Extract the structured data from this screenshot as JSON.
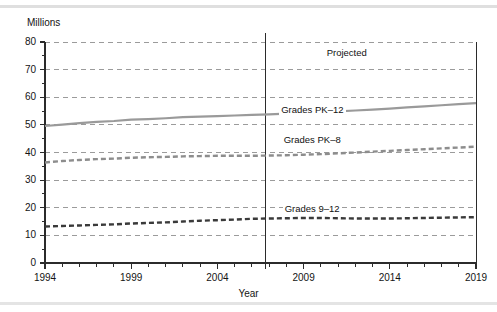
{
  "figure": {
    "y_axis_title": "Millions",
    "x_axis_title": "Year",
    "projected_label": "Projected",
    "series_labels": {
      "pk12": "Grades PK–12",
      "pk8": "Grades PK–8",
      "g912": "Grades 9–12"
    },
    "colors": {
      "pk12_line": "#9a9a9a",
      "pk8_line": "#8d8d8d",
      "g912_line": "#3a3a3a",
      "gridline": "#9b9b9b",
      "axis": "#2b2b2b",
      "text": "#141414",
      "scan_band": "#d9d9d9"
    }
  },
  "chart_data": {
    "type": "line",
    "title": "",
    "subtitle": "",
    "xlabel": "Year",
    "ylabel": "Millions",
    "xlim": [
      1994,
      2019
    ],
    "ylim": [
      0,
      80
    ],
    "y_ticks": [
      0,
      10,
      20,
      30,
      40,
      50,
      60,
      70,
      80
    ],
    "y_tick_labels": [
      "0",
      "10",
      "20",
      "30",
      "40",
      "50",
      "60",
      "70",
      "80"
    ],
    "x_ticks": [
      1994,
      1995,
      1996,
      1997,
      1998,
      1999,
      2000,
      2001,
      2002,
      2003,
      2004,
      2005,
      2006,
      2007,
      2008,
      2009,
      2010,
      2011,
      2012,
      2013,
      2014,
      2015,
      2016,
      2017,
      2018,
      2019
    ],
    "x_tick_labels_shown": [
      "1994",
      "1999",
      "2004",
      "2009",
      "2014",
      "2019"
    ],
    "x_labeled_ticks": [
      1994,
      1999,
      2004,
      2009,
      2014,
      2019
    ],
    "grid": {
      "horizontal": true,
      "vertical": false,
      "style": "dashed"
    },
    "legend": {
      "position": "inline-annotations"
    },
    "annotations": [
      {
        "text": "Projected",
        "x": 2011.5,
        "y": 76,
        "note": "above plot, right of divider"
      },
      {
        "text": "Grades PK–12",
        "x": 2009.5,
        "y": 55.5
      },
      {
        "text": "Grades PK–8",
        "x": 2009.5,
        "y": 44.5
      },
      {
        "text": "Grades 9–12",
        "x": 2009.5,
        "y": 19.5
      }
    ],
    "divider": {
      "x": 2006.8,
      "label": "actual / projected boundary"
    },
    "x": [
      1994,
      1995,
      1996,
      1997,
      1998,
      1999,
      2000,
      2001,
      2002,
      2003,
      2004,
      2005,
      2006,
      2007,
      2008,
      2009,
      2010,
      2011,
      2012,
      2013,
      2014,
      2015,
      2016,
      2017,
      2018,
      2019
    ],
    "series": [
      {
        "name": "Grades PK–12",
        "style": "solid",
        "color": "#9a9a9a",
        "values": [
          49.6,
          50.1,
          50.6,
          51.1,
          51.4,
          51.9,
          52.1,
          52.4,
          52.8,
          53.0,
          53.2,
          53.4,
          53.6,
          53.8,
          54.1,
          54.4,
          54.6,
          54.9,
          55.2,
          55.5,
          55.9,
          56.3,
          56.7,
          57.1,
          57.5,
          57.9
        ]
      },
      {
        "name": "Grades PK–8",
        "style": "dashed",
        "color": "#8d8d8d",
        "values": [
          36.4,
          36.9,
          37.3,
          37.6,
          37.8,
          38.1,
          38.3,
          38.4,
          38.6,
          38.7,
          38.8,
          38.8,
          38.8,
          38.9,
          39.0,
          39.2,
          39.4,
          39.7,
          40.0,
          40.3,
          40.6,
          40.9,
          41.2,
          41.5,
          41.8,
          42.1
        ]
      },
      {
        "name": "Grades 9–12",
        "style": "dashed",
        "color": "#3a3a3a",
        "values": [
          13.2,
          13.4,
          13.6,
          13.8,
          14.0,
          14.3,
          14.5,
          14.7,
          15.0,
          15.3,
          15.5,
          15.7,
          16.0,
          16.1,
          16.2,
          16.3,
          16.3,
          16.2,
          16.1,
          16.1,
          16.1,
          16.2,
          16.3,
          16.4,
          16.5,
          16.6
        ]
      }
    ]
  }
}
